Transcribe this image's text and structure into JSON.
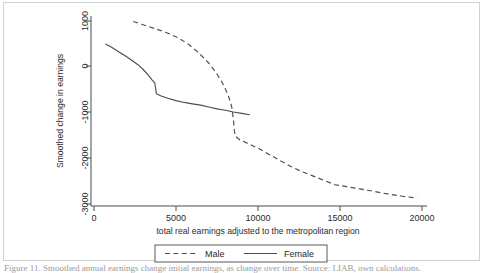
{
  "figure": {
    "caption_partial": "Figure 11. Smoothed annual earnings change initial earnings, as change over time. Source: LIAB, own calculations."
  },
  "chart_data": {
    "type": "line",
    "title": "",
    "xlabel": "total real earnings adjusted to the metropolitan region",
    "ylabel": "Smoothed change in earnings",
    "xlim": [
      0,
      21000
    ],
    "ylim": [
      -3000,
      1300
    ],
    "xticks": [
      0,
      5000,
      10000,
      15000,
      20000
    ],
    "xtick_labels": [
      "0",
      "5000",
      "10000",
      "15000",
      "20000"
    ],
    "yticks": [
      1000,
      0,
      -1000,
      -2000,
      -3000
    ],
    "ytick_labels": [
      "1000",
      "0",
      "-1000",
      "-2000",
      "-3000"
    ],
    "grid": false,
    "legend_position": "below-axis",
    "series": [
      {
        "name": "Male",
        "style": "dashed",
        "color": "#4d4d4d",
        "points": [
          [
            2400,
            990
          ],
          [
            2900,
            930
          ],
          [
            3400,
            870
          ],
          [
            4000,
            800
          ],
          [
            4600,
            720
          ],
          [
            5200,
            620
          ],
          [
            5800,
            480
          ],
          [
            6400,
            300
          ],
          [
            7000,
            80
          ],
          [
            7500,
            -160
          ],
          [
            7900,
            -400
          ],
          [
            8200,
            -640
          ],
          [
            8400,
            -880
          ],
          [
            8500,
            -1150
          ],
          [
            8560,
            -1400
          ],
          [
            8620,
            -1520
          ],
          [
            8900,
            -1600
          ],
          [
            9400,
            -1680
          ],
          [
            10000,
            -1780
          ],
          [
            10600,
            -1900
          ],
          [
            11300,
            -2040
          ],
          [
            12000,
            -2180
          ],
          [
            12600,
            -2280
          ],
          [
            13300,
            -2380
          ],
          [
            14000,
            -2480
          ],
          [
            14700,
            -2580
          ],
          [
            15400,
            -2620
          ],
          [
            16200,
            -2670
          ],
          [
            17000,
            -2720
          ],
          [
            17900,
            -2780
          ],
          [
            18800,
            -2830
          ],
          [
            19700,
            -2870
          ]
        ]
      },
      {
        "name": "Female",
        "style": "solid",
        "color": "#4d4d4d",
        "points": [
          [
            700,
            500
          ],
          [
            1100,
            420
          ],
          [
            1500,
            330
          ],
          [
            1900,
            240
          ],
          [
            2300,
            140
          ],
          [
            2700,
            40
          ],
          [
            3000,
            -60
          ],
          [
            3300,
            -180
          ],
          [
            3550,
            -290
          ],
          [
            3700,
            -350
          ],
          [
            3760,
            -470
          ],
          [
            3800,
            -590
          ],
          [
            4100,
            -640
          ],
          [
            4500,
            -690
          ],
          [
            5000,
            -740
          ],
          [
            5500,
            -780
          ],
          [
            6000,
            -810
          ],
          [
            6500,
            -840
          ],
          [
            7000,
            -880
          ],
          [
            7500,
            -920
          ],
          [
            8000,
            -950
          ],
          [
            8500,
            -990
          ],
          [
            9000,
            -1020
          ],
          [
            9500,
            -1050
          ]
        ]
      }
    ],
    "legend_entries": [
      {
        "label": "Male",
        "style": "dashed"
      },
      {
        "label": "Female",
        "style": "solid"
      }
    ]
  }
}
